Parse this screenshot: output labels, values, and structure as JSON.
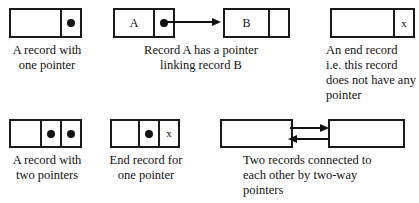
{
  "figure": {
    "ink_color": "#111111",
    "background": "#ffffff"
  },
  "panels": [
    {
      "id": "one-pointer",
      "record_label": "",
      "pointer_glyph": "●",
      "caption": "A record with\none pointer"
    },
    {
      "id": "linked-records",
      "record_a_label": "A",
      "record_b_label": "B",
      "pointer_glyph": "●",
      "caption": "Record A has a pointer\nlinking record B"
    },
    {
      "id": "end-record",
      "record_label": "",
      "null_glyph": "x",
      "caption": "An end record\ni.e. this record\ndoes not have any\npointer"
    },
    {
      "id": "two-pointers",
      "record_label": "",
      "pointer_glyph_1": "●",
      "pointer_glyph_2": "●",
      "caption": "A record with\ntwo pointers"
    },
    {
      "id": "end-record-one-pointer",
      "record_label": "",
      "pointer_glyph": "●",
      "null_glyph": "x",
      "caption": "End record for\none pointer"
    },
    {
      "id": "two-way-pointers",
      "record_left_label": "",
      "record_right_label": "",
      "caption": "Two records connected to\neach other by two-way\npointers"
    }
  ]
}
